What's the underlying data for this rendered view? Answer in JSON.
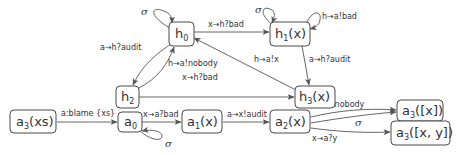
{
  "diagram": {
    "type": "state-machine",
    "nodes": {
      "h0": {
        "base": "h",
        "sub": "0",
        "arg": ""
      },
      "h1": {
        "base": "h",
        "sub": "1",
        "arg": "(x)"
      },
      "h2": {
        "base": "h",
        "sub": "2",
        "arg": ""
      },
      "h3": {
        "base": "h",
        "sub": "3",
        "arg": "(x)"
      },
      "a3xs": {
        "base": "a",
        "sub": "3",
        "arg": "(xs)"
      },
      "a0": {
        "base": "a",
        "sub": "0",
        "arg": ""
      },
      "a1": {
        "base": "a",
        "sub": "1",
        "arg": "(x)"
      },
      "a2": {
        "base": "a",
        "sub": "2",
        "arg": "(x)"
      },
      "a3x": {
        "base": "a",
        "sub": "3",
        "arg": "([x])"
      },
      "a3xy": {
        "base": "a",
        "sub": "3",
        "arg": "([x, y])"
      }
    },
    "edges": [
      {
        "from": "h0",
        "to": "h0",
        "label": "σ"
      },
      {
        "from": "h0",
        "to": "h1",
        "label": "x→h?bad"
      },
      {
        "from": "h1",
        "to": "h1",
        "label": "σ"
      },
      {
        "from": "h1",
        "to": "h1",
        "label": "h→a!bad"
      },
      {
        "from": "h0",
        "to": "h2",
        "label": "a→h?audit"
      },
      {
        "from": "h2",
        "to": "h0",
        "label": "h→a!nobody"
      },
      {
        "from": "h2",
        "to": "h3",
        "label": "x→h?bad"
      },
      {
        "from": "h1",
        "to": "h3",
        "label": "a→h?audit"
      },
      {
        "from": "h3",
        "to": "h0",
        "label": "h→a!x"
      },
      {
        "from": "a3xs",
        "to": "a0",
        "label": "a:blame {xs}"
      },
      {
        "from": "a0",
        "to": "a1",
        "label": "x→a?bad"
      },
      {
        "from": "a0",
        "to": "a0",
        "label": "σ"
      },
      {
        "from": "a1",
        "to": "a2",
        "label": "a→x!audit"
      },
      {
        "from": "a2",
        "to": "a3x",
        "label": "x→a?nobody"
      },
      {
        "from": "a2",
        "to": "a3x",
        "label": "σ"
      },
      {
        "from": "a2",
        "to": "a3xy",
        "label": "x→a?y"
      }
    ]
  }
}
